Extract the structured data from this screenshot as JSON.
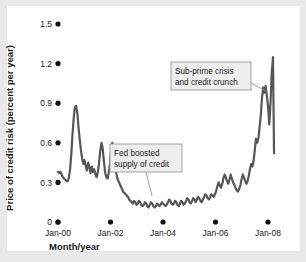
{
  "chart_data": {
    "type": "line",
    "title": "",
    "xlabel": "Month/year",
    "ylabel": "Price of credit risk (percent per year)",
    "ylim": [
      0,
      1.5
    ],
    "yticks": [
      "0",
      "0.3",
      "0.6",
      "0.9",
      "1.2",
      "1.5"
    ],
    "ytick_values": [
      0,
      0.3,
      0.6,
      0.9,
      1.2,
      1.5
    ],
    "xticks": [
      "Jan-00",
      "Jan-02",
      "Jan-04",
      "Jan-06",
      "Jan-08"
    ],
    "xtick_values": [
      2000,
      2002,
      2004,
      2006,
      2008
    ],
    "xlim": [
      2000,
      2008.25
    ],
    "grid": false,
    "legend": null,
    "series": [
      {
        "name": "Price of credit risk",
        "color": "#565656",
        "x": [
          2000.0,
          2000.05,
          2000.09,
          2000.14,
          2000.18,
          2000.23,
          2000.28,
          2000.32,
          2000.37,
          2000.41,
          2000.46,
          2000.51,
          2000.55,
          2000.6,
          2000.64,
          2000.69,
          2000.74,
          2000.78,
          2000.83,
          2000.87,
          2000.92,
          2000.97,
          2001.01,
          2001.06,
          2001.1,
          2001.15,
          2001.2,
          2001.24,
          2001.29,
          2001.33,
          2001.38,
          2001.43,
          2001.47,
          2001.52,
          2001.56,
          2001.61,
          2001.66,
          2001.7,
          2001.75,
          2001.79,
          2001.84,
          2001.89,
          2001.93,
          2001.98,
          2002.02,
          2002.07,
          2002.12,
          2002.16,
          2002.21,
          2002.25,
          2002.3,
          2002.35,
          2002.39,
          2002.44,
          2002.48,
          2002.53,
          2002.58,
          2002.62,
          2002.67,
          2002.71,
          2002.76,
          2002.81,
          2002.85,
          2002.9,
          2002.94,
          2002.99,
          2003.04,
          2003.08,
          2003.13,
          2003.17,
          2003.22,
          2003.27,
          2003.31,
          2003.36,
          2003.4,
          2003.45,
          2003.5,
          2003.54,
          2003.59,
          2003.63,
          2003.68,
          2003.73,
          2003.77,
          2003.82,
          2003.86,
          2003.91,
          2003.96,
          2004.0,
          2004.05,
          2004.09,
          2004.14,
          2004.19,
          2004.23,
          2004.28,
          2004.32,
          2004.37,
          2004.42,
          2004.46,
          2004.51,
          2004.55,
          2004.6,
          2004.65,
          2004.69,
          2004.74,
          2004.78,
          2004.83,
          2004.88,
          2004.92,
          2004.97,
          2005.01,
          2005.06,
          2005.11,
          2005.15,
          2005.2,
          2005.24,
          2005.29,
          2005.34,
          2005.38,
          2005.43,
          2005.47,
          2005.52,
          2005.57,
          2005.61,
          2005.66,
          2005.7,
          2005.75,
          2005.8,
          2005.84,
          2005.89,
          2005.93,
          2005.98,
          2006.03,
          2006.07,
          2006.12,
          2006.16,
          2006.21,
          2006.26,
          2006.3,
          2006.35,
          2006.39,
          2006.44,
          2006.49,
          2006.53,
          2006.58,
          2006.62,
          2006.67,
          2006.72,
          2006.76,
          2006.81,
          2006.85,
          2006.9,
          2006.95,
          2006.99,
          2007.04,
          2007.08,
          2007.13,
          2007.18,
          2007.22,
          2007.27,
          2007.31,
          2007.36,
          2007.41,
          2007.45,
          2007.5,
          2007.54,
          2007.59,
          2007.64,
          2007.68,
          2007.73,
          2007.77,
          2007.82,
          2007.87,
          2007.91,
          2007.96,
          2008.0,
          2008.05,
          2008.1,
          2008.14,
          2008.19,
          2008.23
        ],
        "y": [
          0.38,
          0.37,
          0.38,
          0.36,
          0.34,
          0.33,
          0.32,
          0.31,
          0.31,
          0.33,
          0.4,
          0.52,
          0.66,
          0.79,
          0.87,
          0.88,
          0.82,
          0.72,
          0.62,
          0.55,
          0.48,
          0.44,
          0.47,
          0.42,
          0.39,
          0.45,
          0.41,
          0.37,
          0.42,
          0.38,
          0.4,
          0.36,
          0.34,
          0.38,
          0.44,
          0.54,
          0.6,
          0.56,
          0.46,
          0.38,
          0.34,
          0.33,
          0.37,
          0.44,
          0.54,
          0.6,
          0.53,
          0.44,
          0.38,
          0.34,
          0.31,
          0.29,
          0.27,
          0.25,
          0.23,
          0.22,
          0.21,
          0.2,
          0.19,
          0.17,
          0.16,
          0.15,
          0.14,
          0.16,
          0.15,
          0.13,
          0.14,
          0.16,
          0.15,
          0.13,
          0.12,
          0.13,
          0.15,
          0.14,
          0.12,
          0.11,
          0.13,
          0.15,
          0.14,
          0.12,
          0.11,
          0.12,
          0.14,
          0.13,
          0.12,
          0.13,
          0.15,
          0.14,
          0.13,
          0.12,
          0.13,
          0.15,
          0.17,
          0.16,
          0.14,
          0.13,
          0.14,
          0.16,
          0.15,
          0.13,
          0.12,
          0.14,
          0.16,
          0.15,
          0.13,
          0.14,
          0.16,
          0.18,
          0.17,
          0.15,
          0.14,
          0.16,
          0.18,
          0.17,
          0.15,
          0.17,
          0.19,
          0.18,
          0.16,
          0.15,
          0.17,
          0.19,
          0.21,
          0.2,
          0.18,
          0.17,
          0.19,
          0.21,
          0.2,
          0.19,
          0.21,
          0.24,
          0.27,
          0.3,
          0.28,
          0.26,
          0.29,
          0.33,
          0.36,
          0.34,
          0.31,
          0.29,
          0.32,
          0.36,
          0.33,
          0.3,
          0.28,
          0.26,
          0.24,
          0.23,
          0.25,
          0.28,
          0.32,
          0.36,
          0.34,
          0.31,
          0.29,
          0.31,
          0.35,
          0.4,
          0.44,
          0.42,
          0.46,
          0.55,
          0.63,
          0.6,
          0.64,
          0.72,
          0.82,
          0.94,
          1.02,
          0.98,
          1.03,
          0.95,
          0.88,
          0.74,
          0.92,
          1.12,
          1.25,
          0.52
        ]
      }
    ],
    "annotations": [
      {
        "id": "annotation-fed",
        "text_lines": [
          "Fed boosted",
          "supply of credit"
        ],
        "box_x": 110,
        "box_y": 144,
        "box_w": 72,
        "box_h": 28,
        "leader": [
          [
            146,
            172
          ],
          [
            152,
            196
          ]
        ]
      },
      {
        "id": "annotation-subprime",
        "text_lines": [
          "Sub-prime crisis",
          "and credit crunch"
        ],
        "box_x": 171,
        "box_y": 62,
        "box_w": 80,
        "box_h": 28,
        "leader": [
          [
            251,
            83
          ],
          [
            268,
            92
          ]
        ]
      }
    ],
    "colors": {
      "line": "#565656",
      "tick_dot": "#111111",
      "text": "#1a1a1a",
      "annotation_fill": "#eeeeee",
      "annotation_border": "#999999",
      "figure_background": "#e9e9e9",
      "plot_background": "#ffffff"
    }
  },
  "axis": {
    "y_title": "Price of credit risk (percent per year)",
    "x_title": "Month/year"
  }
}
